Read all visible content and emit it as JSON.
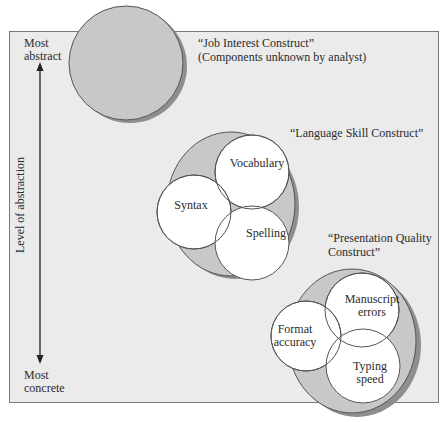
{
  "axis": {
    "top_label_line1": "Most",
    "top_label_line2": "abstract",
    "bottom_label_line1": "Most",
    "bottom_label_line2": "concrete",
    "title": "Level of abstraction"
  },
  "constructs": [
    {
      "name": "“Job Interest Construct”",
      "subtitle": "(Components unknown by analyst)",
      "components": []
    },
    {
      "name": "“Language Skill Construct”",
      "components": [
        "Vocabulary",
        "Syntax",
        "Spelling"
      ]
    },
    {
      "name_line1": "“Presentation Quality",
      "name_line2": "Construct”",
      "components": [
        {
          "line1": "Manuscript",
          "line2": "errors"
        },
        {
          "line1": "Format",
          "line2": "accuracy"
        },
        {
          "line1": "Typing",
          "line2": "speed"
        }
      ]
    }
  ],
  "colors": {
    "panel_bg": "#ebebeb",
    "construct_fill": "#c8c8c8",
    "shadow": "#8e8e8e",
    "component_fill": "#ffffff",
    "stroke": "#555555"
  }
}
